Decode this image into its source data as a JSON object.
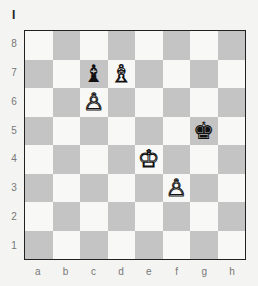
{
  "diagram": {
    "number": "I",
    "ranks": [
      "8",
      "7",
      "6",
      "5",
      "4",
      "3",
      "2",
      "1"
    ],
    "files": [
      "a",
      "b",
      "c",
      "d",
      "e",
      "f",
      "g",
      "h"
    ],
    "pieces": [
      {
        "square": "c7",
        "color": "black",
        "type": "bishop",
        "glyph": "♝"
      },
      {
        "square": "d7",
        "color": "white",
        "type": "bishop",
        "glyph": "♗"
      },
      {
        "square": "c6",
        "color": "white",
        "type": "pawn",
        "glyph": "♙"
      },
      {
        "square": "g5",
        "color": "black",
        "type": "king",
        "glyph": "♚"
      },
      {
        "square": "e4",
        "color": "white",
        "type": "king",
        "glyph": "♔"
      },
      {
        "square": "f3",
        "color": "white",
        "type": "pawn",
        "glyph": "♙"
      }
    ],
    "colors": {
      "light_square": "#f8f8f6",
      "dark_square": "#c4c4c4",
      "border": "#222222"
    }
  }
}
